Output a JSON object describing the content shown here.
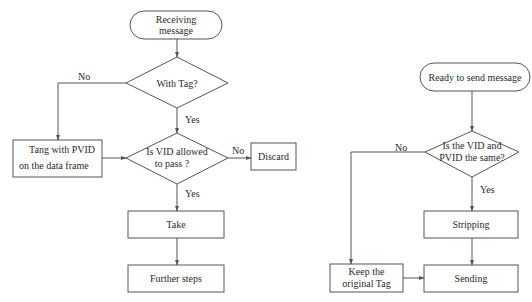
{
  "diagram": {
    "colors": {
      "stroke": "#555555",
      "text": "#2a2a2a",
      "background": "#ffffff"
    },
    "receive_flow": {
      "start": {
        "line1": "Receiving",
        "line2": "message"
      },
      "decision_tag": {
        "label": "With Tag?"
      },
      "edge_no_tag": "No",
      "edge_yes_tag": "Yes",
      "tag_pvid": {
        "line1": "Tang with PVID",
        "line2": "on the data frame"
      },
      "decision_vid": {
        "line1": "Is VID allowed",
        "line2": "to pass ?"
      },
      "edge_no_vid": "No",
      "discard": {
        "label": "Discard"
      },
      "edge_yes_vid": "Yes",
      "take": {
        "label": "Take"
      },
      "further": {
        "label": "Further steps"
      }
    },
    "send_flow": {
      "start": {
        "label": "Ready to send message"
      },
      "decision_same": {
        "line1": "Is the VID and",
        "line2": "PVID the same?"
      },
      "edge_no_same": "No",
      "edge_yes_same": "Yes",
      "stripping": {
        "label": "Stripping"
      },
      "keep_tag": {
        "line1": "Keep the",
        "line2": "original Tag"
      },
      "sending": {
        "label": "Sending"
      }
    }
  }
}
